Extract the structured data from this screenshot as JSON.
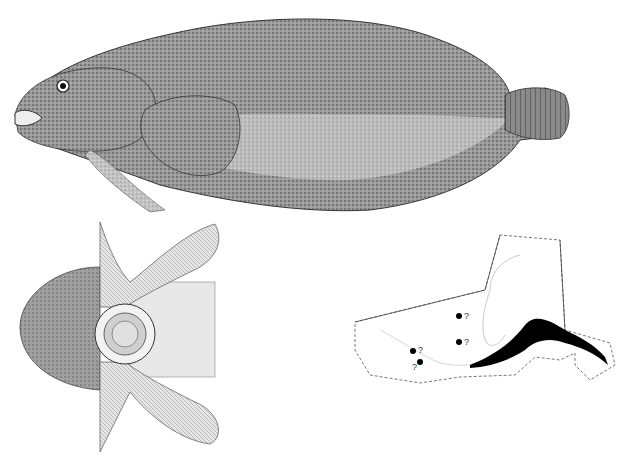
{
  "figure": {
    "panels": [
      {
        "id": "lateral-view",
        "subject": "fish, lateral view"
      },
      {
        "id": "ventral-view",
        "subject": "ventral view showing pelvic sucking disc and pectoral fins"
      },
      {
        "id": "distribution-map",
        "subject": "distribution map of Alaska coast"
      }
    ]
  },
  "map": {
    "range_color": "#000000",
    "border_color": "#555555",
    "points": [
      {
        "x": 119,
        "y": 91,
        "label": "?"
      },
      {
        "x": 119,
        "y": 117,
        "label": "?"
      },
      {
        "x": 73,
        "y": 126,
        "label": "?"
      },
      {
        "x": 80,
        "y": 137,
        "label": "?"
      }
    ]
  },
  "colors": {
    "background": "#ffffff",
    "stipple_dark": "#5a5a5a",
    "stipple_mid": "#8a8a8a",
    "stipple_light": "#c8c8c8"
  }
}
